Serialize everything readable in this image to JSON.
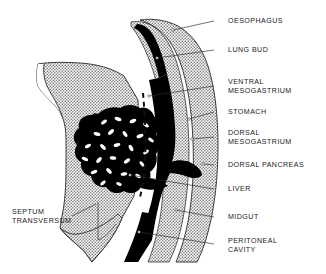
{
  "figure": {
    "kind": "anatomical-diagram",
    "background_color": "#ffffff",
    "ink_color": "#1a1a1a",
    "stipple_color": "#8d8d8d",
    "solid_organ_color": "#000000"
  },
  "labels_right": [
    {
      "id": "oesophagus",
      "text": "OESOPHAGUS",
      "text2": "",
      "x": 228,
      "y": 21,
      "leader_x1": 214,
      "leader_y1": 21,
      "leader_x2": 173,
      "leader_y2": 30
    },
    {
      "id": "lung-bud",
      "text": "LUNG BUD",
      "text2": "",
      "x": 228,
      "y": 50,
      "leader_x1": 214,
      "leader_y1": 50,
      "leader_x2": 157,
      "leader_y2": 58
    },
    {
      "id": "ventral-mesogastrium",
      "text": "VENTRAL",
      "text2": "MESOGASTRIUM",
      "x": 228,
      "y": 82,
      "leader_x1": 214,
      "leader_y1": 86,
      "leader_x2": 149,
      "leader_y2": 96
    },
    {
      "id": "stomach",
      "text": "STOMACH",
      "text2": "",
      "x": 228,
      "y": 112,
      "leader_x1": 214,
      "leader_y1": 112,
      "leader_x2": 189,
      "leader_y2": 119
    },
    {
      "id": "dorsal-mesogastrium",
      "text": "DORSAL",
      "text2": "MESOGASTRIUM",
      "x": 228,
      "y": 133,
      "leader_x1": 214,
      "leader_y1": 137,
      "leader_x2": 192,
      "leader_y2": 139
    },
    {
      "id": "dorsal-pancreas",
      "text": "DORSAL PANCREAS",
      "text2": "",
      "x": 228,
      "y": 165,
      "leader_x1": 214,
      "leader_y1": 165,
      "leader_x2": 203,
      "leader_y2": 164
    },
    {
      "id": "liver",
      "text": "LIVER",
      "text2": "",
      "x": 228,
      "y": 189,
      "leader_x1": 214,
      "leader_y1": 189,
      "leader_x2": 130,
      "leader_y2": 175
    },
    {
      "id": "midgut",
      "text": "MIDGUT",
      "text2": "",
      "x": 228,
      "y": 217,
      "leader_x1": 214,
      "leader_y1": 217,
      "leader_x2": 176,
      "leader_y2": 210
    },
    {
      "id": "peritoneal-cavity",
      "text": "PERITONEAL",
      "text2": "CAVITY",
      "x": 228,
      "y": 241,
      "leader_x1": 214,
      "leader_y1": 244,
      "leader_x2": 139,
      "leader_y2": 232
    }
  ],
  "labels_left": [
    {
      "id": "septum-transversum",
      "text": "SEPTUM",
      "text2": "TRANSVERSUM",
      "x": 12,
      "y": 212,
      "leader_x1": 72,
      "leader_y1": 216,
      "leader_x2": 96,
      "leader_y2": 204
    }
  ]
}
